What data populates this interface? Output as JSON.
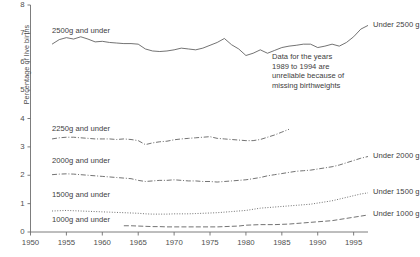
{
  "chart_data": {
    "type": "line",
    "title": "",
    "subtitle": "",
    "xlabel": "",
    "ylabel": "Percentage of live births",
    "xlim": [
      1950,
      1997
    ],
    "ylim": [
      0,
      8
    ],
    "grid": false,
    "legend_position": "inline-right-and-above-series",
    "xticks": [
      1950,
      1955,
      1960,
      1965,
      1970,
      1975,
      1980,
      1985,
      1990,
      1995
    ],
    "yticks": [
      0,
      1,
      2,
      3,
      4,
      5,
      6,
      7,
      8
    ],
    "annotations": [
      {
        "name": "unreliable-data-note",
        "lines": [
          "Data for the years",
          "1989 to 1994 are",
          "unreliable because of",
          "missing birthweights"
        ]
      }
    ],
    "series": [
      {
        "name": "Under 2500 g",
        "inline_label": "2500g and under",
        "right_label": "Under 2500 g",
        "line_style": "solid",
        "x": [
          1953,
          1954,
          1955,
          1956,
          1957,
          1958,
          1959,
          1960,
          1961,
          1962,
          1963,
          1964,
          1965,
          1966,
          1967,
          1968,
          1969,
          1970,
          1971,
          1972,
          1973,
          1974,
          1975,
          1976,
          1977,
          1978,
          1979,
          1980,
          1981,
          1982,
          1983,
          1984,
          1985,
          1986,
          1987,
          1988,
          1989,
          1990,
          1991,
          1992,
          1993,
          1994,
          1995,
          1996,
          1997
        ],
        "y": [
          6.62,
          6.78,
          6.85,
          6.8,
          6.88,
          6.8,
          6.7,
          6.72,
          6.68,
          6.66,
          6.64,
          6.64,
          6.62,
          6.45,
          6.38,
          6.36,
          6.38,
          6.42,
          6.48,
          6.45,
          6.42,
          6.48,
          6.58,
          6.68,
          6.82,
          6.6,
          6.45,
          6.22,
          6.3,
          6.42,
          6.3,
          6.4,
          6.5,
          6.55,
          6.58,
          6.62,
          6.62,
          6.5,
          6.55,
          6.62,
          6.55,
          6.68,
          6.88,
          7.15,
          7.28
        ]
      },
      {
        "name": "Under 2250 g",
        "inline_label": "2250g and under",
        "right_label": "",
        "line_style": "dashdot",
        "x": [
          1953,
          1954,
          1955,
          1956,
          1957,
          1958,
          1959,
          1960,
          1961,
          1962,
          1963,
          1964,
          1965,
          1966,
          1967,
          1968,
          1969,
          1970,
          1971,
          1972,
          1973,
          1974,
          1975,
          1976,
          1977,
          1978,
          1979,
          1980,
          1981,
          1982,
          1983,
          1984,
          1985,
          1986
        ],
        "y": [
          3.28,
          3.32,
          3.34,
          3.34,
          3.32,
          3.3,
          3.28,
          3.28,
          3.28,
          3.26,
          3.28,
          3.26,
          3.22,
          3.08,
          3.14,
          3.18,
          3.2,
          3.25,
          3.28,
          3.3,
          3.32,
          3.34,
          3.36,
          3.3,
          3.28,
          3.26,
          3.24,
          3.22,
          3.22,
          3.26,
          3.34,
          3.42,
          3.52,
          3.62
        ]
      },
      {
        "name": "Under 2000 g",
        "inline_label": "2000g and under",
        "right_label": "Under 2000 g",
        "line_style": "dashdot",
        "x": [
          1953,
          1954,
          1955,
          1956,
          1957,
          1958,
          1959,
          1960,
          1961,
          1962,
          1963,
          1964,
          1965,
          1966,
          1967,
          1968,
          1969,
          1970,
          1971,
          1972,
          1973,
          1974,
          1975,
          1976,
          1977,
          1978,
          1979,
          1980,
          1981,
          1982,
          1983,
          1984,
          1985,
          1986,
          1987,
          1988,
          1989,
          1990,
          1991,
          1992,
          1993,
          1994,
          1995,
          1996,
          1997
        ],
        "y": [
          2.02,
          2.04,
          2.05,
          2.04,
          2.02,
          2.0,
          1.98,
          1.96,
          1.94,
          1.92,
          1.9,
          1.88,
          1.82,
          1.78,
          1.8,
          1.82,
          1.82,
          1.84,
          1.82,
          1.8,
          1.8,
          1.78,
          1.78,
          1.76,
          1.78,
          1.8,
          1.82,
          1.84,
          1.88,
          1.92,
          1.98,
          2.02,
          2.06,
          2.1,
          2.14,
          2.16,
          2.18,
          2.22,
          2.26,
          2.3,
          2.36,
          2.44,
          2.52,
          2.6,
          2.66
        ]
      },
      {
        "name": "Under 1500 g",
        "inline_label": "1500g and under",
        "right_label": "Under 1500 g",
        "line_style": "dotted",
        "x": [
          1953,
          1954,
          1955,
          1956,
          1957,
          1958,
          1959,
          1960,
          1961,
          1962,
          1963,
          1964,
          1965,
          1966,
          1967,
          1968,
          1969,
          1970,
          1971,
          1972,
          1973,
          1974,
          1975,
          1976,
          1977,
          1978,
          1979,
          1980,
          1981,
          1982,
          1983,
          1984,
          1985,
          1986,
          1987,
          1988,
          1989,
          1990,
          1991,
          1992,
          1993,
          1994,
          1995,
          1996,
          1997
        ],
        "y": [
          0.74,
          0.75,
          0.76,
          0.75,
          0.74,
          0.73,
          0.72,
          0.71,
          0.7,
          0.69,
          0.68,
          0.67,
          0.66,
          0.64,
          0.63,
          0.63,
          0.63,
          0.64,
          0.64,
          0.64,
          0.65,
          0.66,
          0.67,
          0.68,
          0.7,
          0.72,
          0.74,
          0.76,
          0.8,
          0.84,
          0.86,
          0.88,
          0.9,
          0.92,
          0.94,
          0.96,
          0.98,
          1.02,
          1.06,
          1.1,
          1.16,
          1.22,
          1.28,
          1.34,
          1.38
        ]
      },
      {
        "name": "Under 1000 g",
        "inline_label": "1000g and under",
        "right_label": "Under 1000 g",
        "line_style": "dashed",
        "x": [
          1963,
          1964,
          1965,
          1966,
          1967,
          1968,
          1969,
          1970,
          1971,
          1972,
          1973,
          1974,
          1975,
          1976,
          1977,
          1978,
          1979,
          1980,
          1981,
          1982,
          1983,
          1984,
          1985,
          1986,
          1987,
          1988,
          1989,
          1990,
          1991,
          1992,
          1993,
          1994,
          1995,
          1996,
          1997
        ],
        "y": [
          0.22,
          0.22,
          0.21,
          0.2,
          0.19,
          0.19,
          0.18,
          0.18,
          0.18,
          0.18,
          0.18,
          0.18,
          0.18,
          0.18,
          0.19,
          0.2,
          0.21,
          0.24,
          0.25,
          0.26,
          0.26,
          0.26,
          0.27,
          0.28,
          0.3,
          0.32,
          0.34,
          0.36,
          0.38,
          0.4,
          0.44,
          0.48,
          0.52,
          0.56,
          0.6
        ]
      }
    ],
    "inline_label_positions": [
      {
        "label_ref": 0,
        "x_px": 52,
        "y_px": 26
      },
      {
        "label_ref": 1,
        "x_px": 52,
        "y_px": 124
      },
      {
        "label_ref": 2,
        "x_px": 52,
        "y_px": 156
      },
      {
        "label_ref": 3,
        "x_px": 52,
        "y_px": 190
      },
      {
        "label_ref": 4,
        "x_px": 52,
        "y_px": 215
      }
    ],
    "colors": {
      "line": "#5a5a5a",
      "axis": "#6e6e6e",
      "text": "#3d3d3d",
      "background": "#ffffff"
    }
  }
}
